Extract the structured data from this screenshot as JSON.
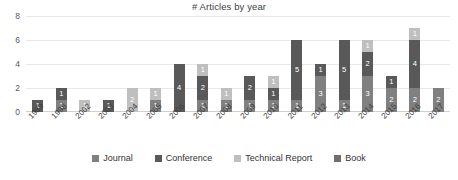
{
  "chart_data": {
    "type": "bar",
    "stacked": true,
    "title": "# Articles by year",
    "xlabel": "",
    "ylabel": "",
    "ylim": [
      0,
      8
    ],
    "yticks": [
      0,
      2,
      4,
      6,
      8
    ],
    "grid": true,
    "legend_position": "bottom",
    "categories": [
      "1989",
      "1998",
      "2002",
      "2003",
      "2004",
      "2005",
      "2006",
      "2007",
      "2008",
      "2009",
      "2010",
      "2011",
      "2012",
      "2013",
      "2014",
      "2015",
      "2016",
      "2017"
    ],
    "series": [
      {
        "name": "Journal",
        "color": "#808080",
        "values": [
          0,
          1,
          0,
          0,
          0,
          1,
          0,
          1,
          1,
          1,
          1,
          1,
          3,
          1,
          3,
          2,
          2,
          2
        ]
      },
      {
        "name": "Conference",
        "color": "#595959",
        "values": [
          1,
          1,
          0,
          1,
          0,
          0,
          4,
          2,
          0,
          2,
          1,
          5,
          1,
          5,
          2,
          1,
          4,
          0
        ]
      },
      {
        "name": "Technical Report",
        "color": "#bfbfbf",
        "values": [
          0,
          0,
          1,
          0,
          2,
          1,
          0,
          1,
          1,
          0,
          1,
          0,
          0,
          0,
          1,
          0,
          1,
          0
        ]
      },
      {
        "name": "Book",
        "color": "#6e6e6e",
        "values": [
          0,
          0,
          0,
          0,
          0,
          0,
          0,
          0,
          0,
          0,
          0,
          0,
          0,
          0,
          0,
          0,
          0,
          0
        ]
      }
    ]
  }
}
